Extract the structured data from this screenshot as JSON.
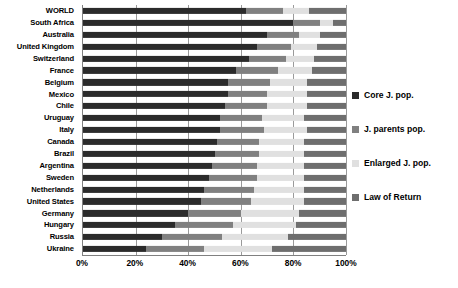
{
  "chart_data": {
    "type": "bar",
    "orientation": "horizontal",
    "stacked": true,
    "title": "",
    "xlabel": "",
    "ylabel": "",
    "xlim": [
      0,
      100
    ],
    "xticks": [
      "0%",
      "20%",
      "40%",
      "60%",
      "80%",
      "100%"
    ],
    "xtick_values": [
      0,
      20,
      40,
      60,
      80,
      100
    ],
    "grid": true,
    "legend_position": "right",
    "categories": [
      "WORLD",
      "South Africa",
      "Australia",
      "United Kingdom",
      "Switzerland",
      "France",
      "Belgium",
      "Mexico",
      "Chile",
      "Uruguay",
      "Italy",
      "Canada",
      "Brazil",
      "Argentina",
      "Sweden",
      "Netherlands",
      "United States",
      "Germany",
      "Hungary",
      "Russia",
      "Ukraine"
    ],
    "series": [
      {
        "name": "Core J. pop.",
        "color": "#2b2b2b",
        "values": [
          62,
          80,
          70,
          66,
          63,
          58,
          55,
          55,
          54,
          52,
          52,
          51,
          50,
          49,
          48,
          46,
          45,
          40,
          35,
          30,
          24
        ]
      },
      {
        "name": "J. parents pop.",
        "color": "#808080",
        "values": [
          14,
          10,
          12,
          13,
          14,
          16,
          16,
          15,
          16,
          16,
          17,
          16,
          17,
          17,
          18,
          19,
          19,
          20,
          22,
          23,
          22
        ]
      },
      {
        "name": "Enlarged J. pop.",
        "color": "#e0e0e0",
        "values": [
          10,
          5,
          8,
          10,
          11,
          13,
          14,
          15,
          15,
          16,
          16,
          17,
          17,
          18,
          18,
          19,
          20,
          22,
          24,
          25,
          26
        ]
      },
      {
        "name": "Law of Return",
        "color": "#6e6e6e",
        "values": [
          14,
          5,
          10,
          11,
          12,
          13,
          15,
          15,
          15,
          16,
          15,
          16,
          16,
          16,
          16,
          16,
          16,
          18,
          19,
          22,
          28
        ]
      }
    ]
  },
  "legend": {
    "items": [
      {
        "label": "Core J. pop.",
        "color": "#2b2b2b",
        "swatch": "square-swatch-core"
      },
      {
        "label": "J. parents pop.",
        "color": "#808080",
        "swatch": "square-swatch-parents"
      },
      {
        "label": "Enlarged J. pop.",
        "color": "#e0e0e0",
        "swatch": "square-swatch-enlarged"
      },
      {
        "label": "Law of Return",
        "color": "#6e6e6e",
        "swatch": "square-swatch-law"
      }
    ]
  }
}
